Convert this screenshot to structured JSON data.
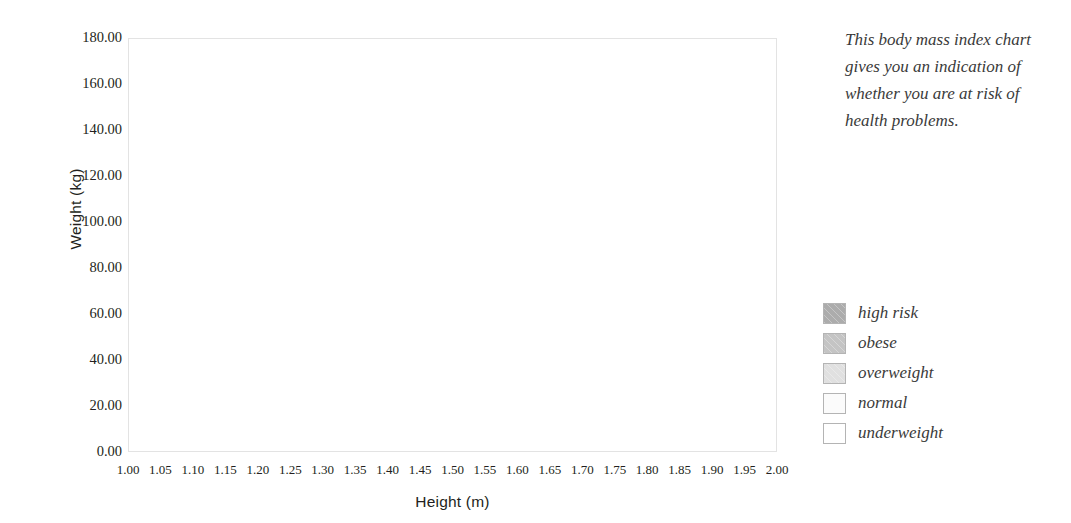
{
  "chart_data": {
    "type": "area",
    "title": "",
    "xlabel": "Height (m)",
    "ylabel": "Weight (kg)",
    "xlim": [
      1.0,
      2.0
    ],
    "ylim": [
      0.0,
      180.0
    ],
    "grid": true,
    "legend_position": "right",
    "x_ticks": [
      "1.00",
      "1.05",
      "1.10",
      "1.15",
      "1.20",
      "1.25",
      "1.30",
      "1.35",
      "1.40",
      "1.45",
      "1.50",
      "1.55",
      "1.60",
      "1.65",
      "1.70",
      "1.75",
      "1.80",
      "1.85",
      "1.90",
      "1.95",
      "2.00"
    ],
    "x_tick_values": [
      1.0,
      1.05,
      1.1,
      1.15,
      1.2,
      1.25,
      1.3,
      1.35,
      1.4,
      1.45,
      1.5,
      1.55,
      1.6,
      1.65,
      1.7,
      1.75,
      1.8,
      1.85,
      1.9,
      1.95,
      2.0
    ],
    "y_ticks": [
      "0.00",
      "20.00",
      "40.00",
      "60.00",
      "80.00",
      "100.00",
      "120.00",
      "140.00",
      "160.00",
      "180.00"
    ],
    "y_tick_values": [
      0,
      20,
      40,
      60,
      80,
      100,
      120,
      140,
      160,
      180
    ],
    "y_minor_step": 10,
    "bands": [
      {
        "name": "underweight",
        "color": "#ffffff",
        "bmi_min": 0,
        "bmi_max": 18.5,
        "boundary_weights_kg": {
          "at_1.00m": 18.5,
          "at_1.50m": 41.6,
          "at_2.00m": 74.0
        }
      },
      {
        "name": "normal",
        "color": "#fbfbfb",
        "bmi_min": 18.5,
        "bmi_max": 25,
        "boundary_weights_kg": {
          "at_1.00m": 25.0,
          "at_1.50m": 56.3,
          "at_2.00m": 100.0
        }
      },
      {
        "name": "overweight",
        "color": "#e0e0e0",
        "bmi_min": 25,
        "bmi_max": 30,
        "boundary_weights_kg": {
          "at_1.00m": 30.0,
          "at_1.50m": 67.5,
          "at_2.00m": 120.0
        }
      },
      {
        "name": "obese",
        "color": "#c4c4c4",
        "bmi_min": 30,
        "bmi_max": 40,
        "boundary_weights_kg": {
          "at_1.00m": 40.0,
          "at_1.50m": 90.0,
          "at_2.00m": 160.0
        }
      },
      {
        "name": "high risk",
        "color": "#acacac",
        "bmi_min": 40,
        "bmi_max": null,
        "boundary_weights_kg": {
          "at_1.00m": 180.0,
          "at_1.50m": 180.0,
          "at_2.00m": 180.0
        }
      }
    ]
  },
  "axes": {
    "y_title": "Weight (kg)",
    "x_title": "Height (m)"
  },
  "side": {
    "description": "This body mass index chart gives you an indication of whether you are at risk of health problems."
  },
  "legend": {
    "items": [
      {
        "label": "high risk",
        "color": "#acacac"
      },
      {
        "label": "obese",
        "color": "#c4c4c4"
      },
      {
        "label": "overweight",
        "color": "#e0e0e0"
      },
      {
        "label": "normal",
        "color": "#fbfbfb"
      },
      {
        "label": "underweight",
        "color": "#ffffff"
      }
    ]
  },
  "colors": {
    "gridline": "#ffffff",
    "frame": "#e3e3e3",
    "text": "#231f20",
    "italic_text": "#3a3a3a"
  }
}
